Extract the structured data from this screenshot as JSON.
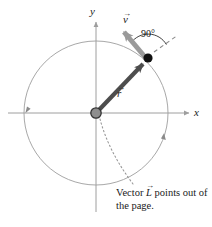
{
  "figure": {
    "axes": {
      "y_label": "y",
      "x_label": "x"
    },
    "vectors": [
      {
        "name": "position-vector",
        "symbol": "r",
        "label": "r",
        "arrow_overline": "→",
        "color": "#4d4d4d",
        "from": "origin",
        "to": "particle"
      },
      {
        "name": "velocity-vector",
        "symbol": "v",
        "label": "v",
        "arrow_overline": "→",
        "color": "#9a9a9a",
        "from": "particle",
        "direction": "tangent, counterclockwise"
      }
    ],
    "angle": {
      "value": "90",
      "unit": "°",
      "label": "90°"
    },
    "caption": {
      "line1_pre": "Vector ",
      "symbol": "L",
      "arrow_overline": "→",
      "line1_post": " points out",
      "line2": "of the page."
    },
    "colors": {
      "axis": "#9e9e9e",
      "circle": "#a8a8a8",
      "position_vector": "#4d4d4d",
      "velocity_vector": "#9a9a9a",
      "particle": "#111111",
      "origin_fill": "#8e8e8e",
      "origin_stroke": "#333333",
      "dashed": "#8a8a8a",
      "text": "#1a1a1a"
    },
    "geometry": {
      "center_x": 96,
      "center_y": 113,
      "radius": 72,
      "particle_x": 148,
      "particle_y": 58,
      "direction": "counterclockwise"
    }
  }
}
